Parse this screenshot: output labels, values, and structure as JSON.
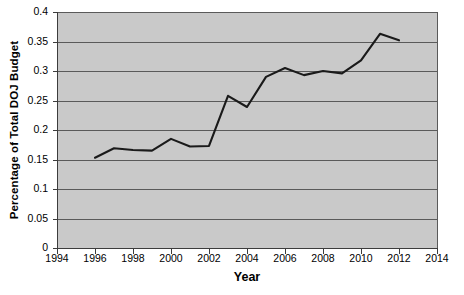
{
  "chart_data": {
    "type": "line",
    "title": "",
    "xlabel": "Year",
    "ylabel": "Percentage of Total DOJ Budget",
    "xlim": [
      1994,
      2014
    ],
    "ylim": [
      0,
      0.4
    ],
    "grid": true,
    "legend": null,
    "x_ticks": [
      1994,
      1996,
      1998,
      2000,
      2002,
      2004,
      2006,
      2008,
      2010,
      2012,
      2014
    ],
    "y_ticks": [
      0,
      0.05,
      0.1,
      0.15,
      0.2,
      0.25,
      0.3,
      0.35,
      0.4
    ],
    "x_tick_labels": [
      "1994",
      "1996",
      "1998",
      "2000",
      "2002",
      "2004",
      "2006",
      "2008",
      "2010",
      "2012",
      "2014"
    ],
    "y_tick_labels": [
      "0",
      "0.05",
      "0.1",
      "0.15",
      "0.2",
      "0.25",
      "0.3",
      "0.35",
      "0.4"
    ],
    "series": [
      {
        "name": "Percentage of Total DOJ Budget",
        "color": "#1a1a1a",
        "x": [
          1996,
          1997,
          1998,
          1999,
          2000,
          2001,
          2002,
          2003,
          2004,
          2005,
          2006,
          2007,
          2008,
          2009,
          2010,
          2011,
          2012
        ],
        "values": [
          0.153,
          0.169,
          0.166,
          0.165,
          0.185,
          0.172,
          0.173,
          0.258,
          0.239,
          0.29,
          0.305,
          0.293,
          0.3,
          0.296,
          0.318,
          0.363,
          0.352
        ]
      }
    ],
    "plot_background": "#c9c9c9",
    "gridline_color": "#5a5a5a",
    "axis_color": "#3c3c3c",
    "page_background": "#ffffff"
  }
}
